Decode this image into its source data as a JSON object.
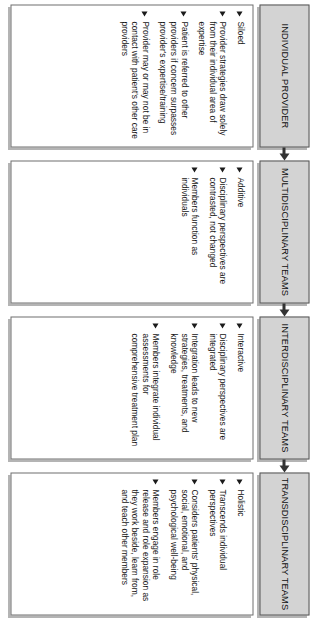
{
  "diagram": {
    "orientation": "rotated-90-ccw",
    "connector": "arrow-right",
    "colors": {
      "header_fill": "#d3d3d3",
      "header_border": "#555555",
      "body_fill": "#ffffff",
      "body_border": "#6e6e6e",
      "shadow": "#b4b4b4",
      "text": "#141414",
      "bullet": "#1b1b1b"
    },
    "stages": [
      {
        "id": "individual-provider",
        "title": "INDIVIDUAL PROVIDER",
        "bullets": [
          "Siloed",
          "Provider strategies draw solely from their individual area of expertise",
          "Patient is referred to other providers if concern surpasses provider's expertise/training",
          "Provider may or may not be in contact with patient's other care providers"
        ]
      },
      {
        "id": "multidisciplinary-teams",
        "title": "MULTIDISCIPLINARY TEAMS",
        "bullets": [
          "Additive",
          "Disciplinary perspectives are contrasted, not changed",
          "Members function as individuals"
        ]
      },
      {
        "id": "interdisciplinary-teams",
        "title": "INTERDISCIPLINARY TEAMS",
        "bullets": [
          "Interactive",
          "Disciplinary perspectives are integrated",
          "Integration leads to new strategies, treatments, and knowledge",
          "Members integrate individual assessments for comprehensive treatment plan"
        ]
      },
      {
        "id": "transdisciplinary-teams",
        "title": "TRANSDISCIPLINARY TEAMS",
        "bullets": [
          "Holistic",
          "Transcends individual perspectives",
          "Considers patients' physical, social, emotional, and psychological well-being",
          "Members engage in role release and role expansion as they work beside, learn from, and teach other members"
        ]
      }
    ]
  }
}
